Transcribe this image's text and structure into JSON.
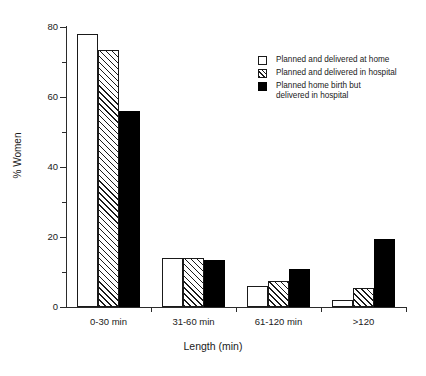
{
  "chart_data": {
    "type": "bar",
    "title": "",
    "xlabel": "Length (min)",
    "ylabel": "% Women",
    "categories": [
      "0-30 min",
      "31-60 min",
      "61-120 min",
      ">120"
    ],
    "ylim": [
      0,
      80
    ],
    "yticks": [
      0,
      20,
      40,
      60,
      80
    ],
    "ytick_labels": [
      "0",
      "20",
      "40",
      "60",
      "80"
    ],
    "yminor_ticks": [
      10,
      30,
      50,
      70
    ],
    "grid": false,
    "legend_position": "upper right",
    "series": [
      {
        "name": "Planned and delivered at home",
        "fill": "open",
        "values": [
          78,
          14,
          6,
          2
        ]
      },
      {
        "name": "Planned and delivered in hospital",
        "fill": "hatch",
        "values": [
          73.5,
          14,
          7.5,
          5.5
        ]
      },
      {
        "name": "Planned home birth but delivered in hospital",
        "fill": "solid",
        "values": [
          56,
          13.5,
          11,
          19.5
        ]
      }
    ]
  },
  "legend": {
    "items": [
      {
        "label": "Planned and delivered at home",
        "fill": "open"
      },
      {
        "label": "Planned and delivered in hospital",
        "fill": "hatch"
      },
      {
        "label_line1": "Planned home birth but",
        "label_line2": "delivered in hospital",
        "fill": "solid"
      }
    ]
  },
  "colors": {
    "axis": "#2b2b2b",
    "text": "#1a1a1a",
    "bar_outline": "#1a1a1a",
    "bar_solid": "#000000",
    "background": "#ffffff"
  }
}
